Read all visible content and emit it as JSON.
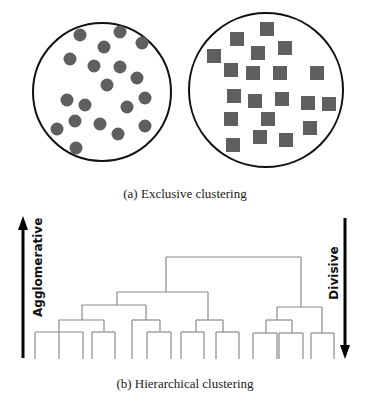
{
  "figure": {
    "panel_a": {
      "caption": "(a) Exclusive clustering",
      "cluster_left": {
        "shape": "circle",
        "color": "#5f5f5f",
        "center": [
          102,
          92
        ],
        "radius": 69,
        "points": [
          [
            80,
            35
          ],
          [
            120,
            32
          ],
          [
            142,
            43
          ],
          [
            104,
            47
          ],
          [
            70,
            59
          ],
          [
            94,
            66
          ],
          [
            120,
            67
          ],
          [
            137,
            78
          ],
          [
            107,
            85
          ],
          [
            67,
            100
          ],
          [
            85,
            105
          ],
          [
            127,
            107
          ],
          [
            145,
            98
          ],
          [
            75,
            121
          ],
          [
            100,
            124
          ],
          [
            57,
            129
          ],
          [
            145,
            126
          ],
          [
            118,
            134
          ],
          [
            76,
            148
          ]
        ]
      },
      "cluster_right": {
        "shape": "square",
        "color": "#5f5f5f",
        "center": [
          266,
          90
        ],
        "radius": 77,
        "points": [
          [
            267,
            29
          ],
          [
            237,
            39
          ],
          [
            285,
            48
          ],
          [
            258,
            53
          ],
          [
            214,
            56
          ],
          [
            231,
            70
          ],
          [
            253,
            73
          ],
          [
            280,
            73
          ],
          [
            317,
            73
          ],
          [
            234,
            96
          ],
          [
            255,
            101
          ],
          [
            282,
            99
          ],
          [
            308,
            103
          ],
          [
            329,
            104
          ],
          [
            231,
            119
          ],
          [
            268,
            119
          ],
          [
            310,
            128
          ],
          [
            260,
            137
          ],
          [
            286,
            140
          ],
          [
            233,
            145
          ]
        ]
      }
    },
    "panel_b": {
      "caption": "(b) Hierarchical clustering",
      "left_arrow_label": "Agglomerative",
      "right_arrow_label": "Divisive",
      "dendrogram_color": "#8a8a8a",
      "leaf_bottom_y": 359,
      "segments": [
        [
          166,
          257,
          301,
          257
        ],
        [
          166,
          257,
          166,
          292
        ],
        [
          301,
          257,
          301,
          307
        ],
        [
          117,
          292,
          208,
          292
        ],
        [
          117,
          292,
          117,
          305
        ],
        [
          208,
          292,
          208,
          320
        ],
        [
          82,
          305,
          146,
          305
        ],
        [
          82,
          305,
          82,
          320
        ],
        [
          146,
          305,
          146,
          320
        ],
        [
          59,
          320,
          104,
          320
        ],
        [
          59,
          320,
          59,
          359
        ],
        [
          104,
          320,
          104,
          332
        ],
        [
          35,
          332,
          83,
          332
        ],
        [
          35,
          332,
          35,
          359
        ],
        [
          83,
          332,
          83,
          359
        ],
        [
          92,
          332,
          115,
          332
        ],
        [
          92,
          332,
          92,
          359
        ],
        [
          115,
          332,
          115,
          359
        ],
        [
          132,
          320,
          160,
          320
        ],
        [
          132,
          320,
          132,
          359
        ],
        [
          160,
          320,
          160,
          332
        ],
        [
          147,
          332,
          171,
          332
        ],
        [
          147,
          332,
          147,
          359
        ],
        [
          171,
          332,
          171,
          359
        ],
        [
          196,
          320,
          223,
          320
        ],
        [
          196,
          320,
          196,
          332
        ],
        [
          223,
          320,
          223,
          332
        ],
        [
          181,
          332,
          204,
          332
        ],
        [
          181,
          332,
          181,
          359
        ],
        [
          204,
          332,
          204,
          359
        ],
        [
          216,
          332,
          239,
          332
        ],
        [
          216,
          332,
          216,
          359
        ],
        [
          239,
          332,
          239,
          359
        ],
        [
          277,
          307,
          322,
          307
        ],
        [
          277,
          307,
          277,
          320
        ],
        [
          322,
          307,
          322,
          333
        ],
        [
          266,
          320,
          292,
          320
        ],
        [
          266,
          320,
          266,
          333
        ],
        [
          292,
          320,
          292,
          333
        ],
        [
          253,
          333,
          277,
          333
        ],
        [
          253,
          333,
          253,
          359
        ],
        [
          277,
          333,
          277,
          359
        ],
        [
          279,
          333,
          303,
          333
        ],
        [
          279,
          333,
          279,
          359
        ],
        [
          303,
          333,
          303,
          359
        ],
        [
          311,
          333,
          334,
          333
        ],
        [
          311,
          333,
          311,
          359
        ],
        [
          334,
          333,
          334,
          359
        ]
      ]
    }
  }
}
